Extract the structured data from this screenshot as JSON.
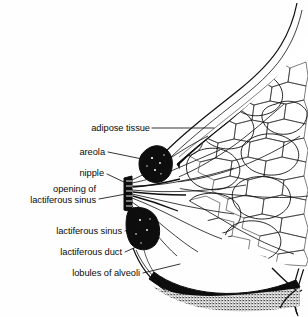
{
  "figure": {
    "style": "black-and-white line illustration",
    "background_color": "#fefefe",
    "ink_color": "#111111",
    "width": 308,
    "height": 317
  },
  "labels": [
    {
      "id": "adipose-tissue",
      "text": "adipose tissue",
      "lines": [
        "adipose tissue"
      ],
      "text_x": 150,
      "text_y": 131,
      "leader": "M152,128 L214,128",
      "target": "fatty tissue beneath the skin in the upper breast"
    },
    {
      "id": "areola",
      "text": "areola",
      "lines": [
        "areola"
      ],
      "text_x": 105,
      "text_y": 155,
      "leader": "M108,152 L145,159",
      "target": "dark pigmented area around the nipple"
    },
    {
      "id": "nipple",
      "text": "nipple",
      "lines": [
        "nipple"
      ],
      "text_x": 104,
      "text_y": 176,
      "leader": "M107,174 L126,182",
      "target": "nipple tip at the apex of the breast"
    },
    {
      "id": "opening-of-lactiferous-sinus",
      "text": "opening of lactiferous sinus",
      "lines": [
        "opening of",
        "lactiferous sinus"
      ],
      "text_x": 96,
      "text_y": 192,
      "text_y2": 203,
      "leader": "M99,199 L127,199",
      "target": "duct openings at the nipple surface"
    },
    {
      "id": "lactiferous-sinus",
      "text": "lactiferous sinus",
      "lines": [
        "lactiferous sinus"
      ],
      "text_x": 122,
      "text_y": 234,
      "leader": "M125,231 L146,224",
      "target": "widened duct segment behind the areola"
    },
    {
      "id": "lactiferous-duct",
      "text": "lactiferous duct",
      "lines": [
        "lactiferous duct"
      ],
      "text_x": 122,
      "text_y": 255,
      "leader": "M125,252 L142,245",
      "target": "milk duct running toward the nipple"
    },
    {
      "id": "lobules-of-alveoli",
      "text": "lobules of alveoli",
      "lines": [
        "lobules of alveoli"
      ],
      "text_x": 140,
      "text_y": 276,
      "leader": "M143,273 L175,265",
      "target": "clustered glandular lobules in the lower breast"
    }
  ]
}
